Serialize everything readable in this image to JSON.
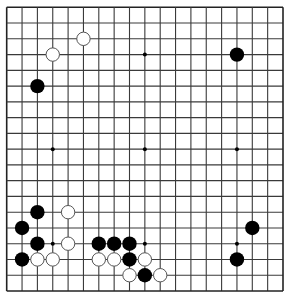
{
  "board": {
    "size": 19,
    "origin_x": 6.7,
    "origin_y": 7.3,
    "spacing_x": 15.35,
    "spacing_y": 15.76,
    "stone_radius": 7.2,
    "line_color": "#3a3a3a",
    "border_color": "#222222",
    "background": "#ffffff",
    "black_stone_color": "#000000",
    "white_stone_fill": "#ffffff",
    "white_stone_stroke": "#555555",
    "star_points": [
      [
        3,
        3
      ],
      [
        9,
        3
      ],
      [
        15,
        3
      ],
      [
        3,
        9
      ],
      [
        9,
        9
      ],
      [
        15,
        9
      ],
      [
        3,
        15
      ],
      [
        9,
        15
      ],
      [
        15,
        15
      ]
    ]
  },
  "stones": {
    "white": [
      [
        5,
        2
      ],
      [
        3,
        3
      ],
      [
        4,
        13
      ],
      [
        4,
        15
      ],
      [
        2,
        16
      ],
      [
        3,
        16
      ],
      [
        6,
        16
      ],
      [
        7,
        16
      ],
      [
        9,
        16
      ],
      [
        8,
        17
      ],
      [
        10,
        17
      ]
    ],
    "black": [
      [
        15,
        3
      ],
      [
        2,
        5
      ],
      [
        2,
        13
      ],
      [
        1,
        14
      ],
      [
        16,
        14
      ],
      [
        2,
        15
      ],
      [
        6,
        15
      ],
      [
        7,
        15
      ],
      [
        8,
        15
      ],
      [
        1,
        16
      ],
      [
        8,
        16
      ],
      [
        15,
        16
      ],
      [
        9,
        17
      ]
    ]
  }
}
